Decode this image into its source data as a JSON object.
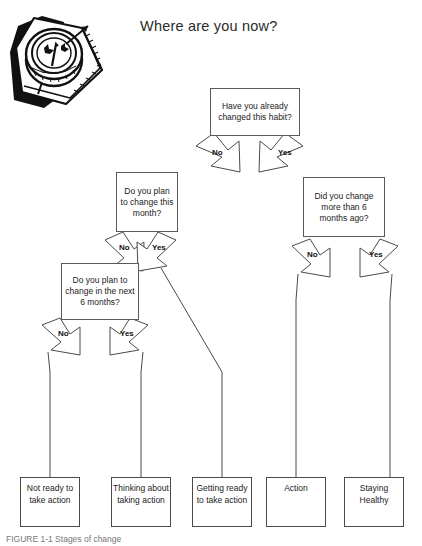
{
  "title": "Where are you now?",
  "artwork": {
    "name": "compass-on-map-illustration"
  },
  "nodes": {
    "q1": "Have you already changed this habit?",
    "q2": "Do you plan to change this month?",
    "q3": "Do you plan to change in the next 6 months?",
    "q4": "Did you change more than 6 months ago?"
  },
  "edge_labels": {
    "q1_no": "No",
    "q1_yes": "Yes",
    "q2_no": "No",
    "q2_yes": "Yes",
    "q3_no": "No",
    "q3_yes": "Yes",
    "q4_no": "No",
    "q4_yes": "Yes"
  },
  "outcomes": [
    {
      "id": "not-ready",
      "label": "Not ready to take action"
    },
    {
      "id": "thinking",
      "label": "Thinking about taking action"
    },
    {
      "id": "getting-ready",
      "label": "Getting ready to take action"
    },
    {
      "id": "action",
      "label": "Action"
    },
    {
      "id": "staying-healthy",
      "label": "Staying Healthy"
    }
  ],
  "caption": "FIGURE 1-1  Stages of change",
  "colors": {
    "stroke": "#5a5a5a",
    "text": "#1b1b1b",
    "background": "#ffffff"
  }
}
